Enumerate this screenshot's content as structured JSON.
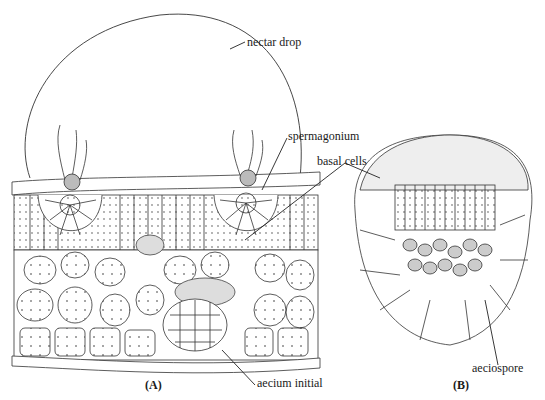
{
  "figure": {
    "panels": [
      {
        "id": "A",
        "label": "(A)",
        "description": "Leaf cross-section with spermagonia and aecium initial"
      },
      {
        "id": "B",
        "label": "(B)",
        "description": "Aecium section showing basal cells and aeciospores"
      }
    ],
    "annotations": {
      "nectar_drop": "nectar drop",
      "spermagonium": "spermagonium",
      "basal_cells": "basal cells",
      "aecium_initial": "aecium initial",
      "aeciospore": "aeciospore"
    },
    "colors": {
      "line": "#2a2a2a",
      "background": "#ffffff"
    }
  }
}
